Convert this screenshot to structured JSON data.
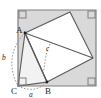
{
  "figure": {
    "canvas": {
      "width": 101,
      "height": 98
    },
    "colors": {
      "outer_square_fill": "#d9d9d9",
      "outer_square_stroke": "#808080",
      "inner_square_fill": "#ffffff",
      "inner_square_stroke": "#595959",
      "triangle_fill": "#f2f2f2",
      "line_stroke": "#595959",
      "dashed_stroke": "#8c8c8c",
      "label_color": "#231f20",
      "right_angle_stroke": "#808080"
    },
    "outer_square": {
      "label": "outer-square",
      "points": "18,10 96,10 96,86 18,86"
    },
    "inner_square": {
      "label": "inner-square",
      "points": "25,33 70,12 93,58 47,82"
    },
    "triangle": {
      "label": "triangle-ABC",
      "points": "25,33 47,82 18,86",
      "vertices": [
        "A",
        "B",
        "C"
      ]
    },
    "segments": [
      {
        "name": "segment-A-to-B",
        "x1": 25,
        "y1": 33,
        "x2": 47,
        "y2": 82
      },
      {
        "name": "segment-A-to-right-vertex",
        "x1": 25,
        "y1": 33,
        "x2": 93,
        "y2": 58
      }
    ],
    "right_angle_marks": [
      {
        "name": "right-angle-outer-top-left",
        "x": 19,
        "y": 11
      },
      {
        "name": "right-angle-outer-top-right",
        "x": 88,
        "y": 11
      },
      {
        "name": "right-angle-outer-bottom-left",
        "x": 19,
        "y": 78
      },
      {
        "name": "right-angle-outer-bottom-right",
        "x": 88,
        "y": 78
      }
    ],
    "arcs": [
      {
        "name": "arc-side-b",
        "d": "M 25,33 C 10,48 8,68 18,86"
      },
      {
        "name": "arc-side-a",
        "d": "M 18,86 C 28,91 38,91 47,82"
      },
      {
        "name": "arc-angle-c",
        "d": "M 50,44 C 45,54 45,64 43,75"
      }
    ],
    "labels": {
      "vertex_A": "A",
      "vertex_B": "B",
      "vertex_C": "C",
      "side_a": "a",
      "side_b": "b",
      "side_c": "c"
    }
  }
}
